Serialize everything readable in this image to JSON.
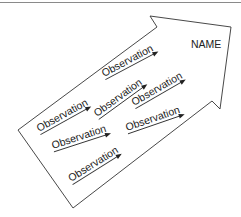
{
  "diagram": {
    "arrow_label": "NAME",
    "observations": [
      {
        "label": "Observation",
        "x": 104,
        "y": 77,
        "angle": -28,
        "line_len": 60
      },
      {
        "label": "Observation",
        "x": 39,
        "y": 132,
        "angle": -29,
        "line_len": 58
      },
      {
        "label": "Observation",
        "x": 97,
        "y": 117,
        "angle": -36,
        "line_len": 60
      },
      {
        "label": "Observation",
        "x": 134,
        "y": 106,
        "angle": -30,
        "line_len": 58
      },
      {
        "label": "Observation",
        "x": 53,
        "y": 149,
        "angle": -18,
        "line_len": 60
      },
      {
        "label": "Observation",
        "x": 127,
        "y": 131,
        "angle": -19,
        "line_len": 60
      },
      {
        "label": "Observation",
        "x": 71,
        "y": 182,
        "angle": -32,
        "line_len": 58
      }
    ],
    "colors": {
      "stroke": "#333333",
      "text": "#222222",
      "background": "#ffffff",
      "top_rule": "#8a8a8a"
    }
  }
}
